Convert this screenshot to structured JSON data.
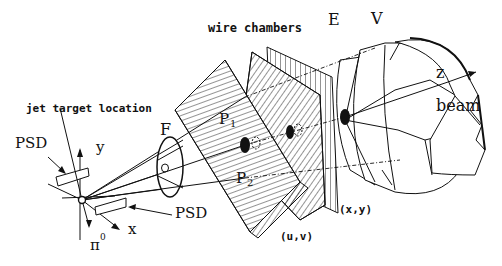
{
  "diagram": {
    "labels": {
      "wire_chambers": "wire chambers",
      "E": "E",
      "V": "V",
      "z": "z",
      "beam": "beam",
      "jet_target": "jet target location",
      "F": "F",
      "P1_main": "P",
      "P1_sub": "1",
      "P2_main": "P",
      "P2_sub": "2",
      "psd_left": "PSD",
      "psd_right": "PSD",
      "y": "y",
      "x": "x",
      "pi0_main": "π",
      "pi0_sup": "0",
      "uv": "(u,v)",
      "xy": "(x,y)"
    },
    "components": [
      "jet target",
      "PSD detectors",
      "F counter",
      "wire chambers (u,v)",
      "wire chambers (x,y)",
      "E calorimeter",
      "V veto"
    ]
  }
}
